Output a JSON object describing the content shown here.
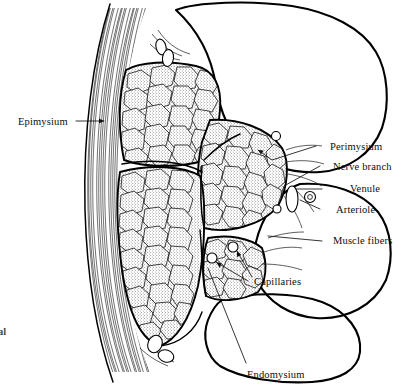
{
  "figure": {
    "background_color": "#ffffff",
    "ink_color": "#000000",
    "width": 408,
    "height": 386
  },
  "labels": {
    "epimysium": "Epimysium",
    "perimysium": "Perimysium",
    "nerve_branch": "Nerve branch",
    "venule": "Venule",
    "arteriole": "Arteriole",
    "muscle_fibers": "Muscle fibers",
    "capillaries": "Capillaries",
    "endomysium": "Endomysium",
    "cropped_margin_text": "al"
  },
  "structures": {
    "fascicles_stippled": 4,
    "fascicles_outline_only": 3,
    "epimysium_side": "left",
    "stipple_texture": "dotted"
  }
}
